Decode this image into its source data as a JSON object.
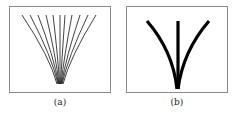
{
  "figure": {
    "panels": [
      {
        "id": "a",
        "caption": "(a)",
        "description": "many thin curves converging to a point",
        "stroke_color": "#111111",
        "curve_count": 11
      },
      {
        "id": "b",
        "caption": "(b)",
        "description": "three thick curves converging to a point",
        "stroke_color": "#000000",
        "curve_count": 3
      }
    ]
  }
}
